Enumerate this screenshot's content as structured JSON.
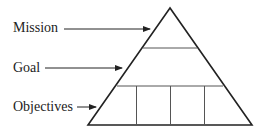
{
  "diagram": {
    "type": "pyramid",
    "labels": {
      "top": "Mission",
      "middle": "Goal",
      "bottom": "Objectives"
    },
    "bottom_tier_segments": 4,
    "stroke_color": "#222222",
    "background": "#ffffff"
  }
}
